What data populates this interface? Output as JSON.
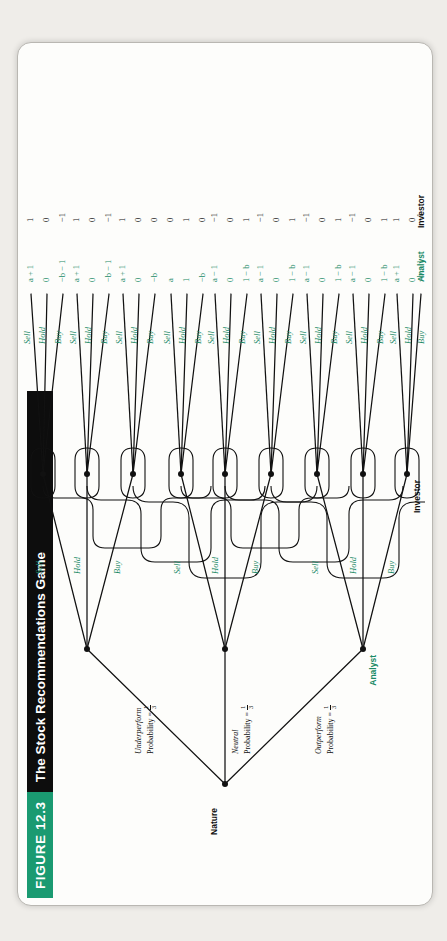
{
  "figure": {
    "number_label": "FIGURE 12.3",
    "title": "The Stock Recommendations Game",
    "accent_color": "#1a9a71",
    "title_bar_color": "#0d0d0d",
    "action_label_color": "#1a8a66"
  },
  "players": {
    "nature": "Nature",
    "analyst": "Analyst",
    "investor": "Investor"
  },
  "nature_branches": [
    {
      "name": "Outperform",
      "prob_label": "Probability =",
      "prob_num": "1",
      "prob_den": "3"
    },
    {
      "name": "Neutral",
      "prob_label": "Probability =",
      "prob_num": "1",
      "prob_den": "3"
    },
    {
      "name": "Underperform",
      "prob_label": "Probability =",
      "prob_num": "1",
      "prob_den": "3"
    }
  ],
  "analyst_actions": [
    "Buy",
    "Hold",
    "Sell"
  ],
  "investor_actions": [
    "Buy",
    "Hold",
    "Sell"
  ],
  "payoff_rows": {
    "analyst": "Analyst",
    "investor": "Investor"
  },
  "terminal_nodes": [
    {
      "analyst_action": "Buy",
      "investor_action": "Buy",
      "analyst_payoff": "a + 1",
      "investor_payoff": "1"
    },
    {
      "analyst_action": "Buy",
      "investor_action": "Hold",
      "analyst_payoff": "0",
      "investor_payoff": "0"
    },
    {
      "analyst_action": "Buy",
      "investor_action": "Sell",
      "analyst_payoff": "−b − 1",
      "investor_payoff": "−1"
    },
    {
      "analyst_action": "Hold",
      "investor_action": "Buy",
      "analyst_payoff": "a + 1",
      "investor_payoff": "1"
    },
    {
      "analyst_action": "Hold",
      "investor_action": "Hold",
      "analyst_payoff": "0",
      "investor_payoff": "0"
    },
    {
      "analyst_action": "Hold",
      "investor_action": "Sell",
      "analyst_payoff": "−b − 1",
      "investor_payoff": "−1"
    },
    {
      "analyst_action": "Sell",
      "investor_action": "Buy",
      "analyst_payoff": "a + 1",
      "investor_payoff": "1"
    },
    {
      "analyst_action": "Sell",
      "investor_action": "Hold",
      "analyst_payoff": "0",
      "investor_payoff": "0"
    },
    {
      "analyst_action": "Sell",
      "investor_action": "Sell",
      "analyst_payoff": "−b",
      "investor_payoff": "0"
    },
    {
      "analyst_action": "Buy",
      "investor_action": "Buy",
      "analyst_payoff": "a",
      "investor_payoff": "0"
    },
    {
      "analyst_action": "Buy",
      "investor_action": "Hold",
      "analyst_payoff": "1",
      "investor_payoff": "1"
    },
    {
      "analyst_action": "Buy",
      "investor_action": "Sell",
      "analyst_payoff": "−b",
      "investor_payoff": "0"
    },
    {
      "analyst_action": "Hold",
      "investor_action": "Buy",
      "analyst_payoff": "a − 1",
      "investor_payoff": "−1"
    },
    {
      "analyst_action": "Hold",
      "investor_action": "Hold",
      "analyst_payoff": "0",
      "investor_payoff": "0"
    },
    {
      "analyst_action": "Hold",
      "investor_action": "Sell",
      "analyst_payoff": "1 − b",
      "investor_payoff": "1"
    },
    {
      "analyst_action": "Sell",
      "investor_action": "Buy",
      "analyst_payoff": "a − 1",
      "investor_payoff": "−1"
    },
    {
      "analyst_action": "Sell",
      "investor_action": "Hold",
      "analyst_payoff": "0",
      "investor_payoff": "0"
    },
    {
      "analyst_action": "Sell",
      "investor_action": "Sell",
      "analyst_payoff": "1 − b",
      "investor_payoff": "1"
    },
    {
      "analyst_action": "Buy",
      "investor_action": "Buy",
      "analyst_payoff": "a − 1",
      "investor_payoff": "−1"
    },
    {
      "analyst_action": "Buy",
      "investor_action": "Hold",
      "analyst_payoff": "0",
      "investor_payoff": "0"
    },
    {
      "analyst_action": "Buy",
      "investor_action": "Sell",
      "analyst_payoff": "1 − b",
      "investor_payoff": "1"
    },
    {
      "analyst_action": "Hold",
      "investor_action": "Buy",
      "analyst_payoff": "a − 1",
      "investor_payoff": "−1"
    },
    {
      "analyst_action": "Hold",
      "investor_action": "Hold",
      "analyst_payoff": "0",
      "investor_payoff": "0"
    },
    {
      "analyst_action": "Sell",
      "investor_action": "Sell",
      "analyst_payoff": "1 − b",
      "investor_payoff": "1"
    }
  ]
}
